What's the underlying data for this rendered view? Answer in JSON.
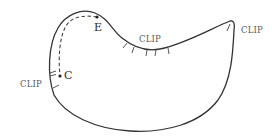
{
  "diagram": {
    "colors": {
      "stroke": "#333333",
      "label": "#5a5a5a",
      "background": "#ffffff"
    },
    "points": [
      {
        "id": "E",
        "label": "E"
      },
      {
        "id": "C",
        "label": "C"
      }
    ],
    "clip_labels": [
      {
        "id": "clip-left",
        "label": "CLIP"
      },
      {
        "id": "clip-middle",
        "label": "CLIP"
      },
      {
        "id": "clip-right",
        "label": "CLIP"
      }
    ]
  }
}
